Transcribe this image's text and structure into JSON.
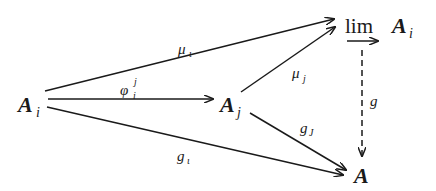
{
  "diagram": {
    "type": "commutative-diagram",
    "nodes": {
      "Ai": {
        "base": "A",
        "sub": "i"
      },
      "Aj": {
        "base": "A",
        "sub": "j"
      },
      "lim": {
        "op": "lim",
        "base": "A",
        "sub": "i"
      },
      "A": {
        "base": "A"
      }
    },
    "edges": {
      "mu_i": {
        "from": "Ai",
        "to": "lim",
        "base": "μ",
        "sub": "ι",
        "style": "solid"
      },
      "phi": {
        "from": "Ai",
        "to": "Aj",
        "base": "φ",
        "sub": "i",
        "sup": "j",
        "style": "solid"
      },
      "g_i": {
        "from": "Ai",
        "to": "A",
        "base": "g",
        "sub": "ι",
        "style": "solid"
      },
      "mu_j": {
        "from": "Aj",
        "to": "lim",
        "base": "μ",
        "sub": "j",
        "style": "solid"
      },
      "g_j": {
        "from": "Aj",
        "to": "A",
        "base": "g",
        "sub": "J",
        "style": "solid"
      },
      "g": {
        "from": "lim",
        "to": "A",
        "base": "g",
        "style": "dashed"
      }
    },
    "colors": {
      "ink": "#1a1a1a",
      "background": "#ffffff"
    }
  }
}
